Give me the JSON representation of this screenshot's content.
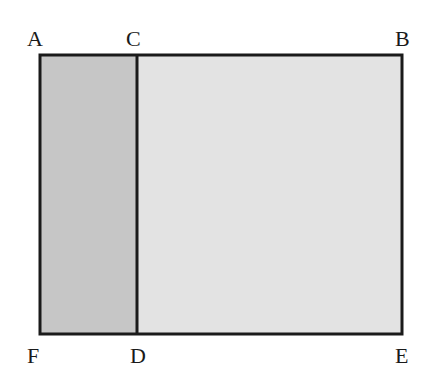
{
  "diagram": {
    "type": "rectangle-partition",
    "colors": {
      "left_region": "#c6c6c6",
      "right_region": "#e3e3e3",
      "stroke": "#1a1a1a"
    },
    "points": {
      "A": "A",
      "B": "B",
      "C": "C",
      "D": "D",
      "E": "E",
      "F": "F"
    },
    "regions": [
      {
        "name": "ACDF",
        "shade": "dark"
      },
      {
        "name": "CBED",
        "shade": "light"
      }
    ]
  }
}
